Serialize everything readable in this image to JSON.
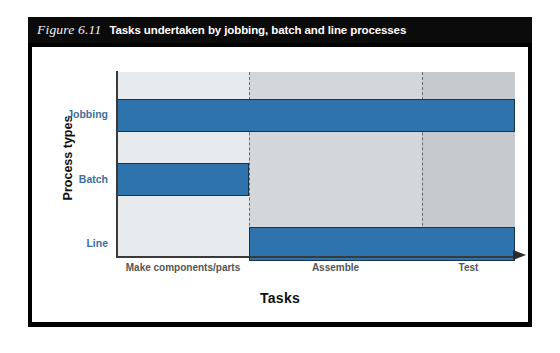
{
  "figure": {
    "number": "Figure 6.11",
    "caption": "Tasks undertaken by jobbing, batch and line processes"
  },
  "colors": {
    "bar_fill": "#2E73AC",
    "bar_stroke": "#17344C",
    "band_light": "#E8EBEE",
    "band_medium": "#D4D7DA",
    "band_dark": "#C7CACD",
    "category_label": "#3F6F9C",
    "tick_label": "#555555",
    "caption_bar": "#0B0B0B",
    "frame": "#000000"
  },
  "chart_data": {
    "type": "bar",
    "orientation": "horizontal",
    "title": "Tasks undertaken by jobbing, batch and line processes",
    "xlabel": "Tasks",
    "ylabel": "Process types",
    "categories": [
      "Jobbing",
      "Batch",
      "Line"
    ],
    "x_tick_labels": [
      "Make components/parts",
      "Assemble",
      "Test"
    ],
    "x_stages": [
      "Make components/parts",
      "Assemble",
      "Test"
    ],
    "grid": false,
    "legend": false,
    "series": [
      {
        "name": "Task span",
        "spans": [
          {
            "category": "Jobbing",
            "start_stage": 0,
            "end_stage": 3,
            "stages_covered": [
              "Make components/parts",
              "Assemble",
              "Test"
            ]
          },
          {
            "category": "Batch",
            "start_stage": 0,
            "end_stage": 1,
            "stages_covered": [
              "Make components/parts"
            ]
          },
          {
            "category": "Line",
            "start_stage": 1,
            "end_stage": 3,
            "stages_covered": [
              "Assemble",
              "Test"
            ]
          }
        ]
      }
    ],
    "bars": [
      {
        "label": "Jobbing",
        "left_pct": 0,
        "width_pct": 100,
        "row_top_pct": 14.5,
        "row_height_pct": 18.0
      },
      {
        "label": "Batch",
        "left_pct": 0,
        "width_pct": 33.2,
        "row_top_pct": 49.5,
        "row_height_pct": 18.0
      },
      {
        "label": "Line",
        "left_pct": 33.2,
        "width_pct": 66.8,
        "row_top_pct": 84.5,
        "row_height_pct": 18.0
      }
    ],
    "annotations": [
      "Dashed vertical lines separate the three task stages",
      "Background shading darkens from left to right across task stages"
    ]
  },
  "axis": {
    "y_title": "Process types",
    "x_title": "Tasks",
    "arrow_icon": "right-arrow-icon"
  }
}
